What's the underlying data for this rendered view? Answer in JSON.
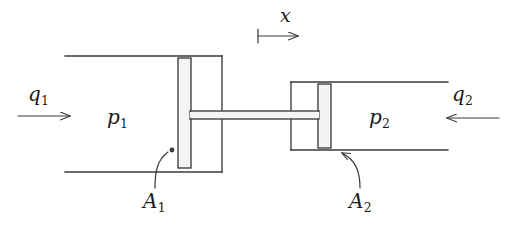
{
  "figure": {
    "type": "engineering-schematic",
    "width": 516,
    "height": 236,
    "background_color": "#ffffff",
    "line_color": "#3a3a3a",
    "text_color": "#1a1a1a"
  },
  "labels": {
    "displacement": {
      "symbol": "x",
      "sub": "",
      "x": 285,
      "y": 12
    },
    "flow_left": {
      "symbol": "q",
      "sub": "1",
      "x": 33,
      "y": 86
    },
    "flow_right": {
      "symbol": "q",
      "sub": "2",
      "x": 455,
      "y": 86
    },
    "pressure_left": {
      "symbol": "p",
      "sub": "1",
      "x": 110,
      "y": 108
    },
    "pressure_right": {
      "symbol": "p",
      "sub": "2",
      "x": 372,
      "y": 108
    },
    "area_left": {
      "symbol": "A",
      "sub": "1",
      "x": 146,
      "y": 196
    },
    "area_right": {
      "symbol": "A",
      "sub": "2",
      "x": 352,
      "y": 196
    }
  },
  "arrows": {
    "displacement": {
      "name": "x-dimension-arrow",
      "x1": 258,
      "y1": 36,
      "x2": 306,
      "y2": 36,
      "direction": "right",
      "has_start_tick": true
    },
    "flow_left": {
      "name": "q1-flow-arrow",
      "x1": 18,
      "y1": 116,
      "x2": 78,
      "y2": 116,
      "direction": "right",
      "has_start_tick": false
    },
    "flow_right": {
      "name": "q2-flow-arrow",
      "x1": 499,
      "y1": 118,
      "x2": 439,
      "y2": 118,
      "direction": "left",
      "has_start_tick": false
    }
  },
  "leaders": {
    "area_left": {
      "name": "a1-leader-line",
      "from_x": 155,
      "from_y": 186,
      "to_x": 176,
      "to_y": 150,
      "has_dot": true
    },
    "area_right": {
      "name": "a2-leader-line",
      "from_x": 360,
      "from_y": 186,
      "to_x": 334,
      "to_y": 152,
      "has_dot": false
    }
  },
  "geometry": {
    "left_chamber": {
      "name": "left-cylinder-chamber",
      "top_pipe_y": 56,
      "bottom_pipe_y": 172,
      "pipe_left_x": 65,
      "wall_x": 222
    },
    "right_chamber": {
      "name": "right-cylinder-chamber",
      "top_pipe_y": 82,
      "bottom_pipe_y": 150,
      "pipe_right_x": 448,
      "wall_x": 291
    },
    "piston_left": {
      "name": "left-piston-plate",
      "x": 178,
      "y": 58,
      "width": 13,
      "height": 110
    },
    "piston_right": {
      "name": "right-piston-plate",
      "x": 318,
      "y": 84,
      "width": 13,
      "height": 64
    },
    "connecting_rod": {
      "name": "piston-connecting-rod",
      "x": 178,
      "y": 111,
      "width": 153,
      "height": 8
    }
  }
}
